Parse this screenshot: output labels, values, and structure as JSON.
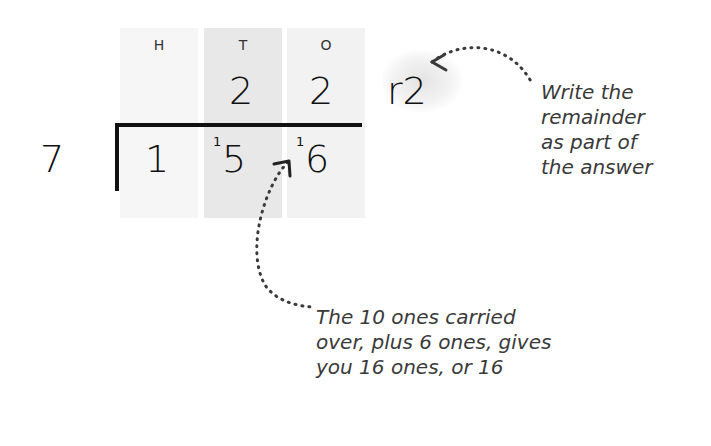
{
  "diagram": {
    "type": "short-division",
    "columns": [
      {
        "label": "H"
      },
      {
        "label": "T"
      },
      {
        "label": "O"
      }
    ],
    "divisor": "7",
    "dividend_digits": [
      "1",
      "5",
      "6"
    ],
    "carries": [
      "1",
      "1"
    ],
    "quotient_digits": [
      "2",
      "2"
    ],
    "remainder": "r2",
    "annotations": {
      "remainder_note": [
        "Write the",
        "remainder",
        "as part of",
        "the answer"
      ],
      "carry_note": [
        "The 10 ones carried",
        "over, plus 6 ones, gives",
        "you 16 ones, or 16"
      ]
    },
    "colors": {
      "text": "#1a1a1a",
      "note_text": "#3a3a3a",
      "column_light": "#f6f6f6",
      "column_mid": "#e8e8e8"
    }
  }
}
